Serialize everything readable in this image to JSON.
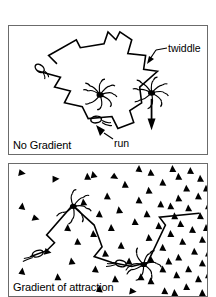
{
  "figure": {
    "type": "scientific-diagram",
    "background_color": "#ffffff",
    "stroke_color": "#000000",
    "panel_border_color": "#6b6b6b"
  },
  "panels": [
    {
      "id": "no-gradient",
      "caption": "No Gradient",
      "description": "Random walk trajectory of a bacterium with no chemical gradient present",
      "frame": {
        "x": 8,
        "y": 25,
        "width": 200,
        "height": 130
      },
      "triangle_count": 0,
      "bacteria": [
        {
          "state": "run",
          "x": 30,
          "y": 42
        },
        {
          "state": "twiddle",
          "x": 92,
          "y": 70
        },
        {
          "state": "twiddle",
          "x": 144,
          "y": 68
        },
        {
          "state": "run",
          "x": 93,
          "y": 122
        }
      ],
      "path_points": "48,38 40,30 68,14 72,22 96,18 100,6 108,14 112,6 124,14 120,28 138,30 136,44 150,46 132,62 134,78 122,86 126,98 110,104 104,92 80,94 74,82 56,78 62,66 46,62 52,52 30,46"
    },
    {
      "id": "gradient-of-attraction",
      "caption": "Gradient of attraction",
      "description": "Biased random walk up an attractant gradient; runs lengthen toward higher attractant concentration",
      "frame": {
        "x": 8,
        "y": 163,
        "width": 200,
        "height": 134
      },
      "gradient_direction": "increasing-to-the-right",
      "attractant_symbol": "filled-triangle",
      "bacteria": [
        {
          "state": "run",
          "x": 28,
          "y": 92
        },
        {
          "state": "twiddle",
          "x": 74,
          "y": 45
        },
        {
          "state": "run",
          "x": 112,
          "y": 98
        },
        {
          "state": "twiddle",
          "x": 135,
          "y": 104
        }
      ],
      "path_points": "20,94 38,88 46,80 38,72 64,42 86,62 94,84 86,94 104,100 124,104 140,100 158,62 152,54 190,50"
    }
  ],
  "annotations": [
    {
      "id": "twiddle",
      "label": "twiddle",
      "leader": {
        "from_x": 166,
        "from_y": 48,
        "to_x": 148,
        "to_y": 62
      },
      "points_to": "tumbling bacterium with splayed flagella"
    },
    {
      "id": "run",
      "label": "run",
      "leader": {
        "from_x": 112,
        "from_y": 140,
        "to_x": 96,
        "to_y": 126
      },
      "points_to": "swimming bacterium with bundled flagella"
    }
  ]
}
